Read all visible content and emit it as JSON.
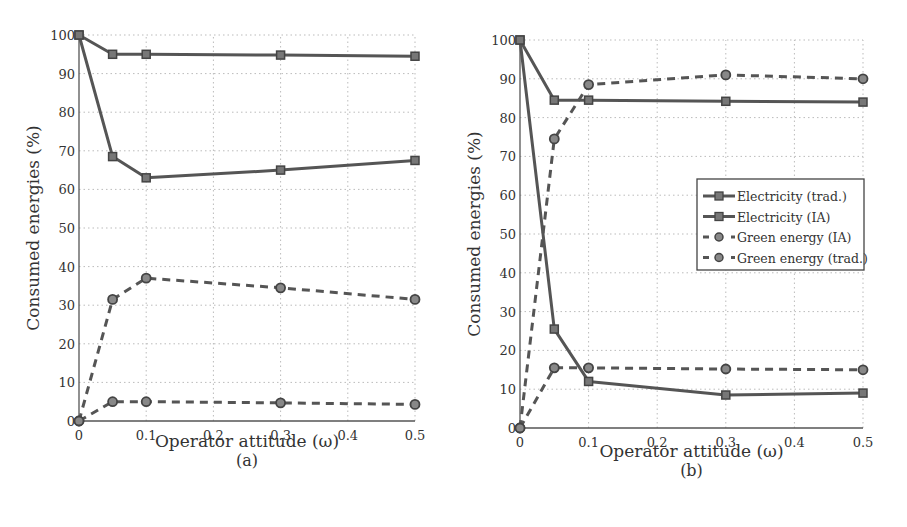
{
  "chart_data": [
    {
      "type": "line",
      "panel_label": "(a)",
      "xlabel": "Operator attitude (ω)",
      "ylabel": "Consumed energies (%)",
      "x_ticks": [
        "0",
        "0.1",
        "0.2",
        "0.3",
        "0.4",
        "0.5"
      ],
      "y_ticks": [
        "0",
        "10",
        "20",
        "30",
        "40",
        "50",
        "60",
        "70",
        "80",
        "90",
        "100"
      ],
      "ylim": [
        0,
        100
      ],
      "xlim": [
        0,
        0.5
      ],
      "grid": true,
      "legend": null,
      "x": [
        0,
        0.05,
        0.1,
        0.3,
        0.5
      ],
      "series": [
        {
          "name": "Electricity (trad.)",
          "style": "solid",
          "marker": "square",
          "values": [
            100,
            95,
            95,
            94.8,
            94.5
          ]
        },
        {
          "name": "Electricity (IA)",
          "style": "solid",
          "marker": "square",
          "values": [
            100,
            68.5,
            63,
            65,
            67.5
          ]
        },
        {
          "name": "Green energy (IA)",
          "style": "dashed",
          "marker": "circle",
          "values": [
            0,
            31.5,
            37,
            34.5,
            31.5
          ]
        },
        {
          "name": "Green energy (trad.)",
          "style": "dashed",
          "marker": "circle",
          "values": [
            0,
            5,
            5,
            4.7,
            4.3
          ]
        }
      ]
    },
    {
      "type": "line",
      "panel_label": "(b)",
      "xlabel": "Operator attitude (ω)",
      "ylabel": "Consumed energies (%)",
      "x_ticks": [
        "0",
        "0.1",
        "0.2",
        "0.3",
        "0.4",
        "0.5"
      ],
      "y_ticks": [
        "0",
        "10",
        "20",
        "30",
        "40",
        "50",
        "60",
        "70",
        "80",
        "90",
        "100"
      ],
      "ylim": [
        0,
        100
      ],
      "xlim": [
        0,
        0.5
      ],
      "grid": true,
      "legend": {
        "position": "center-right",
        "entries": [
          "Electricity (trad.)",
          "Electricity (IA)",
          "Green energy (IA)",
          "Green energy (trad.)"
        ]
      },
      "x": [
        0,
        0.05,
        0.1,
        0.3,
        0.5
      ],
      "series": [
        {
          "name": "Electricity (trad.)",
          "style": "solid",
          "marker": "square",
          "values": [
            100,
            84.5,
            84.5,
            84.2,
            84
          ]
        },
        {
          "name": "Electricity (IA)",
          "style": "solid",
          "marker": "square",
          "values": [
            100,
            25.5,
            12,
            8.5,
            9
          ]
        },
        {
          "name": "Green energy (IA)",
          "style": "dashed",
          "marker": "circle",
          "values": [
            0,
            74.5,
            88.5,
            91,
            90
          ]
        },
        {
          "name": "Green energy (trad.)",
          "style": "dashed",
          "marker": "circle",
          "values": [
            0,
            15.5,
            15.5,
            15.2,
            15
          ]
        }
      ]
    }
  ],
  "colors": {
    "line": "#555555",
    "grid": "#bbbbbb",
    "axis": "#555555",
    "text": "#333333"
  }
}
